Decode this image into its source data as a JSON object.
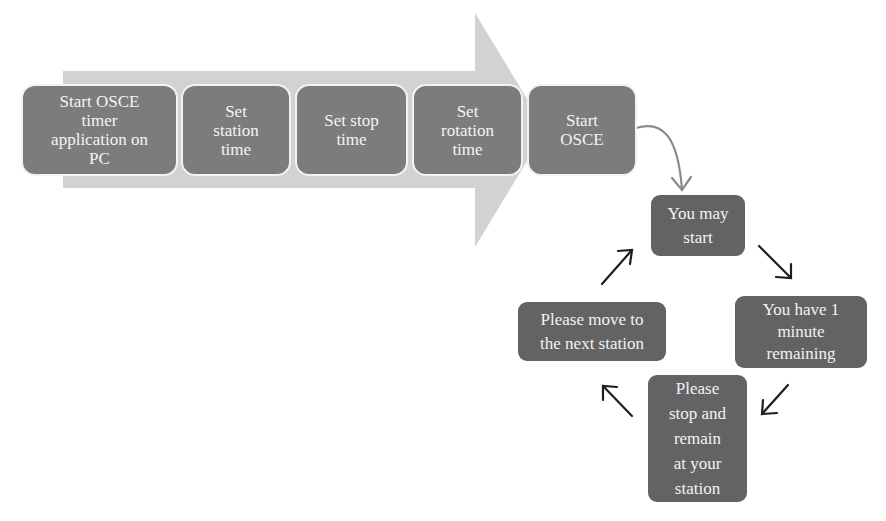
{
  "diagram": {
    "colors": {
      "arrow_band": "#d2d2d2",
      "step_box": "#7c7c7c",
      "step_border": "#f2f2f2",
      "cycle_box": "#636363",
      "text": "#f4f4f4",
      "connector_gray": "#8a8a8a",
      "cycle_arrow": "#1e1e1e"
    },
    "setup_steps": [
      {
        "id": "start-app",
        "label": "Start OSCE\ntimer\napplication on\nPC"
      },
      {
        "id": "set-station-time",
        "label": "Set\nstation\ntime"
      },
      {
        "id": "set-stop-time",
        "label": "Set stop\ntime"
      },
      {
        "id": "set-rotation-time",
        "label": "Set\nrotation\ntime"
      },
      {
        "id": "start-osce",
        "label": "Start\nOSCE"
      }
    ],
    "cycle_steps": [
      {
        "id": "you-may-start",
        "label": "You may\nstart"
      },
      {
        "id": "one-minute-remaining",
        "label": "You have 1\nminute\nremaining"
      },
      {
        "id": "stop-and-remain",
        "label": "Please\nstop and\nremain\nat your\nstation"
      },
      {
        "id": "move-next-station",
        "label": "Please move to\nthe next station"
      }
    ],
    "connectors": [
      {
        "from": "start-osce",
        "to": "you-may-start",
        "style": "curved-gray"
      },
      {
        "from": "you-may-start",
        "to": "one-minute-remaining",
        "style": "arrow-down-right"
      },
      {
        "from": "one-minute-remaining",
        "to": "stop-and-remain",
        "style": "arrow-down-left"
      },
      {
        "from": "stop-and-remain",
        "to": "move-next-station",
        "style": "arrow-up-left"
      },
      {
        "from": "move-next-station",
        "to": "you-may-start",
        "style": "arrow-up-right"
      }
    ]
  }
}
